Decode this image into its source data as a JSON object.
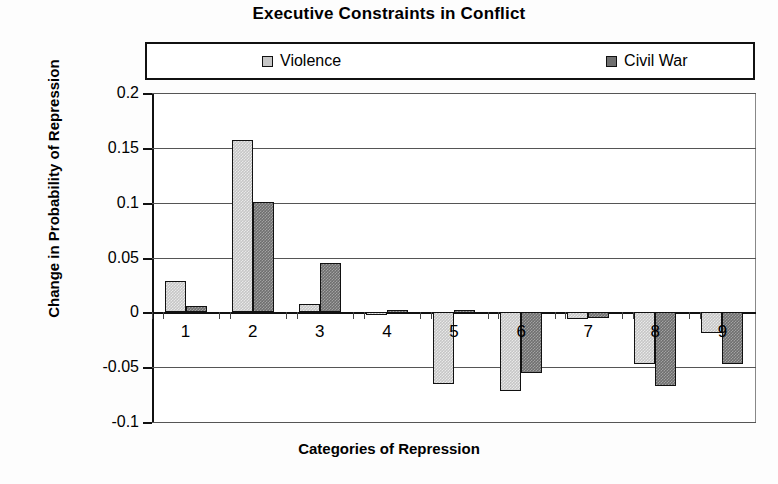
{
  "chart_data": {
    "type": "bar",
    "title": "Executive Constraints in Conflict",
    "xlabel": "Categories of Repression",
    "ylabel": "Change in Probability of Repression",
    "categories": [
      "1",
      "2",
      "3",
      "4",
      "5",
      "6",
      "7",
      "8",
      "9"
    ],
    "series": [
      {
        "name": "Violence",
        "color": "#c6c6c6",
        "values": [
          0.029,
          0.157,
          0.008,
          -0.002,
          -0.065,
          -0.072,
          -0.006,
          -0.047,
          -0.019
        ]
      },
      {
        "name": "Civil War",
        "color": "#6f6f6f",
        "values": [
          0.006,
          0.101,
          0.045,
          0.002,
          0.002,
          -0.055,
          -0.005,
          -0.067,
          -0.047
        ]
      }
    ],
    "ylim": [
      -0.1,
      0.2
    ],
    "yticks": [
      0.2,
      0.15,
      0.1,
      0.05,
      0,
      -0.05,
      -0.1
    ],
    "ytick_labels": [
      "0.2",
      "0.15",
      "0.1",
      "0.05",
      "0",
      "-0.05",
      "-0.1"
    ],
    "grid": true,
    "legend_position": "top"
  }
}
